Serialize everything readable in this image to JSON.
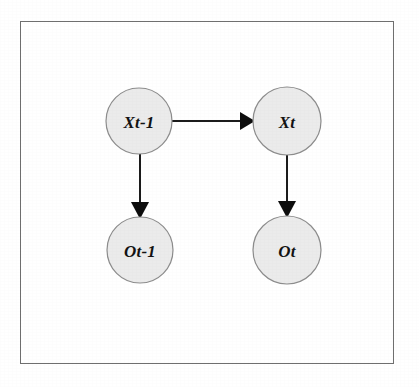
{
  "figure": {
    "kind": "directed-graph-diagram",
    "canvas": {
      "width": 419,
      "height": 387,
      "background": "#ffffff"
    },
    "frame": {
      "x": 20,
      "y": 21,
      "width": 374,
      "height": 343,
      "stroke_color": "#6f6f6f",
      "stroke_width": 1
    },
    "style": {
      "node_fill": "#ebebeb",
      "node_stroke": "#8c8c8c",
      "edge_color": "#1b1b1b",
      "label_color": "#131313"
    }
  },
  "nodes": [
    {
      "id": "x-prev",
      "label": "Xt-1",
      "cx": 139,
      "cy": 121,
      "r": 33
    },
    {
      "id": "x-curr",
      "label": "Xt",
      "cx": 287,
      "cy": 121,
      "r": 34
    },
    {
      "id": "o-prev",
      "label": "Ot-1",
      "cx": 140,
      "cy": 250,
      "r": 33
    },
    {
      "id": "o-curr",
      "label": "Ot",
      "cx": 287,
      "cy": 250,
      "r": 34
    }
  ],
  "edges": [
    {
      "id": "x-prev-to-x-curr",
      "from": "x-prev",
      "to": "x-curr",
      "direction": "horizontal",
      "x1": 172,
      "y1": 121,
      "x2": 253,
      "y2": 121
    },
    {
      "id": "x-prev-to-o-prev",
      "from": "x-prev",
      "to": "o-prev",
      "direction": "vertical",
      "x1": 140,
      "y1": 154,
      "x2": 140,
      "y2": 217
    },
    {
      "id": "x-curr-to-o-curr",
      "from": "x-curr",
      "to": "o-curr",
      "direction": "vertical",
      "x1": 287,
      "y1": 155,
      "x2": 287,
      "y2": 216
    }
  ]
}
